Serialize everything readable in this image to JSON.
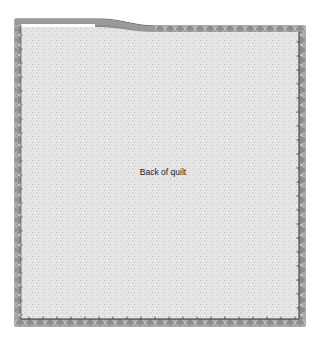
{
  "diagram": {
    "title": "Back of quilt",
    "label_position": {
      "x": 163,
      "y": 172
    },
    "colors": {
      "background": "#ffffff",
      "quilt_fill": "#e6e6e6",
      "speckle": "#a8a8a8",
      "binding": "#8c8c8c",
      "binding_dark": "#555555",
      "binding_light": "#d0d0d0",
      "outline": "#333333"
    },
    "quilt": {
      "outer_left": 15,
      "outer_right": 305,
      "outer_top_left": 19,
      "outer_top_right": 26,
      "slope_start_x": 100,
      "slope_end_x": 155,
      "outer_bottom": 326,
      "binding_width": 6
    }
  }
}
